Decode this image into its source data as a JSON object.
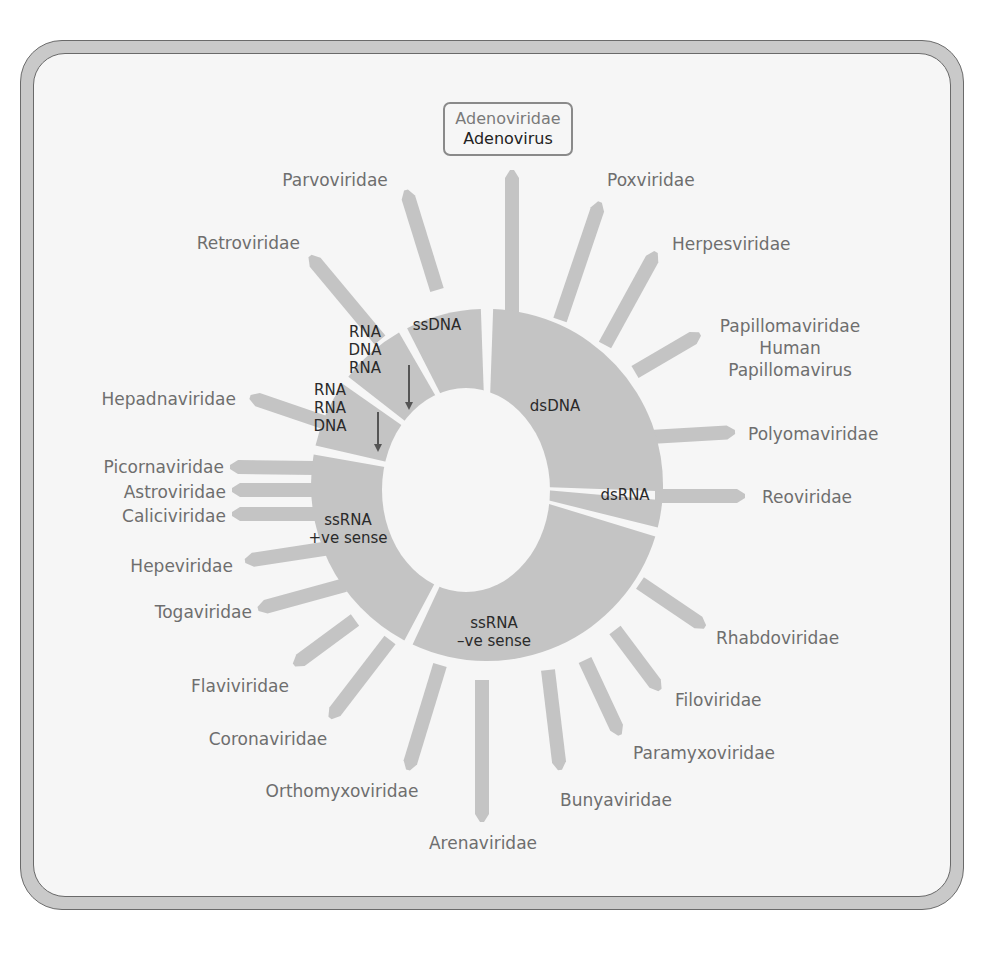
{
  "figure": {
    "title_callout": {
      "family": "Adenoviridae",
      "virus": "Adenovirus"
    },
    "colors": {
      "segment_fill": "#c4c4c4",
      "bar_fill": "#c4c4c4",
      "label_text": "#6e6e6e",
      "segment_text": "#2a2a2a",
      "arrow": "#555555",
      "frame": "#c9c9c9",
      "panel": "#f6f6f6"
    },
    "center": {
      "x": 487,
      "y": 485
    },
    "outer_radius": 176,
    "inner_hole": {
      "cx": 466,
      "cy": 490,
      "rx": 84,
      "ry": 102
    },
    "segments": [
      {
        "id": "dsDNA",
        "lines": [
          "dsDNA"
        ],
        "start": 2,
        "end": 92,
        "label_x": 555,
        "label_y": 411
      },
      {
        "id": "dsRNA",
        "lines": [
          "dsRNA"
        ],
        "start": 95,
        "end": 104,
        "label_x": 625,
        "label_y": 500
      },
      {
        "id": "ssRNA-neg",
        "lines": [
          "ssRNA",
          "–ve sense"
        ],
        "start": 107,
        "end": 205,
        "label_x": 494,
        "label_y": 628
      },
      {
        "id": "ssRNA-pos",
        "lines": [
          "ssRNA",
          "+ve sense"
        ],
        "start": 208,
        "end": 280,
        "label_x": 348,
        "label_y": 525
      },
      {
        "id": "rna-rna-dna",
        "lines": [
          "RNA",
          "RNA",
          "DNA"
        ],
        "start": 283,
        "end": 305,
        "label_x": 330,
        "label_y": 395,
        "arrow": {
          "x": 378,
          "y1": 412,
          "y2": 452
        }
      },
      {
        "id": "rna-dna-rna",
        "lines": [
          "RNA",
          "DNA",
          "RNA"
        ],
        "start": 308,
        "end": 330,
        "label_x": 365,
        "label_y": 337,
        "arrow": {
          "x": 409,
          "y1": 365,
          "y2": 410
        }
      },
      {
        "id": "ssDNA",
        "lines": [
          "ssDNA"
        ],
        "start": 333,
        "end": 358,
        "label_x": 437,
        "label_y": 330
      }
    ],
    "families": [
      {
        "name": "Adenoviridae",
        "segment": "dsDNA",
        "x1": 512,
        "y1": 312,
        "x2": 512,
        "y2": 170,
        "label_x": 508,
        "label_y": 130,
        "anchor": "middle",
        "in_callout": true
      },
      {
        "name": "Poxviridae",
        "segment": "dsDNA",
        "x1": 560,
        "y1": 320,
        "x2": 600,
        "y2": 202,
        "label_x": 607,
        "label_y": 186,
        "anchor": "start"
      },
      {
        "name": "Herpesviridae",
        "segment": "dsDNA",
        "x1": 605,
        "y1": 345,
        "x2": 656,
        "y2": 252,
        "label_x": 672,
        "label_y": 250,
        "anchor": "start"
      },
      {
        "name": "Papillomaviridae",
        "lines": [
          "Papillomaviridae",
          "Human",
          "Papillomavirus"
        ],
        "segment": "dsDNA",
        "x1": 635,
        "y1": 372,
        "x2": 700,
        "y2": 334,
        "label_x": 790,
        "label_y": 332,
        "anchor": "middle"
      },
      {
        "name": "Polyomaviridae",
        "segment": "dsDNA",
        "x1": 650,
        "y1": 437,
        "x2": 735,
        "y2": 432,
        "label_x": 748,
        "label_y": 440,
        "anchor": "start"
      },
      {
        "name": "Reoviridae",
        "segment": "dsRNA",
        "x1": 655,
        "y1": 496,
        "x2": 745,
        "y2": 496,
        "label_x": 762,
        "label_y": 503,
        "anchor": "start"
      },
      {
        "name": "Rhabdoviridae",
        "segment": "ssRNA-neg",
        "x1": 640,
        "y1": 583,
        "x2": 705,
        "y2": 627,
        "label_x": 716,
        "label_y": 644,
        "anchor": "start"
      },
      {
        "name": "Filoviridae",
        "segment": "ssRNA-neg",
        "x1": 615,
        "y1": 630,
        "x2": 660,
        "y2": 690,
        "label_x": 675,
        "label_y": 706,
        "anchor": "start"
      },
      {
        "name": "Paramyxoviridae",
        "segment": "ssRNA-neg",
        "x1": 585,
        "y1": 660,
        "x2": 620,
        "y2": 735,
        "label_x": 633,
        "label_y": 759,
        "anchor": "start"
      },
      {
        "name": "Bunyaviridae",
        "segment": "ssRNA-neg",
        "x1": 548,
        "y1": 670,
        "x2": 560,
        "y2": 770,
        "label_x": 560,
        "label_y": 806,
        "anchor": "start"
      },
      {
        "name": "Arenaviridae",
        "segment": "ssRNA-neg",
        "x1": 482,
        "y1": 680,
        "x2": 482,
        "y2": 822,
        "label_x": 483,
        "label_y": 849,
        "anchor": "middle"
      },
      {
        "name": "Orthomyxoviridae",
        "segment": "ssRNA-neg",
        "x1": 440,
        "y1": 665,
        "x2": 408,
        "y2": 770,
        "label_x": 342,
        "label_y": 797,
        "anchor": "middle"
      },
      {
        "name": "Coronaviridae",
        "segment": "ssRNA-pos",
        "x1": 390,
        "y1": 640,
        "x2": 330,
        "y2": 718,
        "label_x": 268,
        "label_y": 745,
        "anchor": "middle"
      },
      {
        "name": "Flaviviridae",
        "segment": "ssRNA-pos",
        "x1": 355,
        "y1": 620,
        "x2": 294,
        "y2": 665,
        "label_x": 240,
        "label_y": 692,
        "anchor": "middle"
      },
      {
        "name": "Togaviridae",
        "segment": "ssRNA-pos",
        "x1": 345,
        "y1": 585,
        "x2": 258,
        "y2": 609,
        "label_x": 252,
        "label_y": 618,
        "anchor": "end"
      },
      {
        "name": "Hepeviridae",
        "segment": "ssRNA-pos",
        "x1": 330,
        "y1": 548,
        "x2": 245,
        "y2": 561,
        "label_x": 233,
        "label_y": 572,
        "anchor": "end"
      },
      {
        "name": "Caliciviridae",
        "segment": "ssRNA-pos",
        "x1": 315,
        "y1": 514,
        "x2": 232,
        "y2": 514,
        "label_x": 226,
        "label_y": 522,
        "anchor": "end"
      },
      {
        "name": "Astroviridae",
        "segment": "ssRNA-pos",
        "x1": 315,
        "y1": 490,
        "x2": 232,
        "y2": 490,
        "label_x": 226,
        "label_y": 498,
        "anchor": "end"
      },
      {
        "name": "Picornaviridae",
        "segment": "ssRNA-pos",
        "x1": 315,
        "y1": 468,
        "x2": 230,
        "y2": 467,
        "label_x": 224,
        "label_y": 473,
        "anchor": "end"
      },
      {
        "name": "Hepadnaviridae",
        "segment": "rna-rna-dna",
        "x1": 332,
        "y1": 425,
        "x2": 250,
        "y2": 397,
        "label_x": 236,
        "label_y": 405,
        "anchor": "end"
      },
      {
        "name": "Retroviridae",
        "segment": "rna-dna-rna",
        "x1": 380,
        "y1": 340,
        "x2": 310,
        "y2": 256,
        "label_x": 300,
        "label_y": 249,
        "anchor": "end"
      },
      {
        "name": "Parvoviridae",
        "segment": "ssDNA",
        "x1": 437,
        "y1": 290,
        "x2": 406,
        "y2": 190,
        "label_x": 335,
        "label_y": 186,
        "anchor": "middle"
      }
    ]
  }
}
